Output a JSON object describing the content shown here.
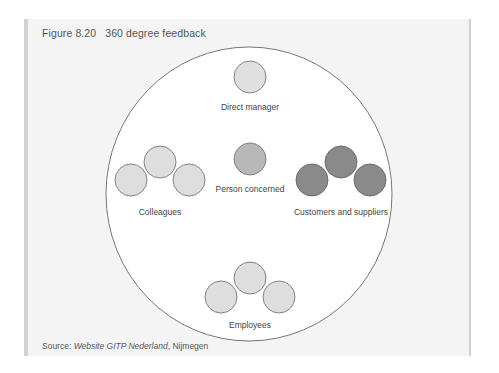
{
  "figure": {
    "number": "Figure 8.20",
    "title": "360 degree feedback"
  },
  "diagram": {
    "groups": [
      {
        "label": "Direct manager",
        "count": 1,
        "fill": "#e0e0e0"
      },
      {
        "label": "Person concerned",
        "count": 1,
        "fill": "#b8b8b8"
      },
      {
        "label": "Colleagues",
        "count": 3,
        "fill": "#dedede"
      },
      {
        "label": "Customers and suppliers",
        "count": 3,
        "fill": "#8a8a8a"
      },
      {
        "label": "Employees",
        "count": 3,
        "fill": "#dedede"
      }
    ]
  },
  "source": {
    "prefix": "Source: ",
    "text": "Website GITP Nederland",
    "suffix": ", Nijmegen"
  },
  "colors": {
    "panel_bg": "#f4f4f4",
    "outer_circle_fill": "#ffffff",
    "stroke": "#777777",
    "light_circle": "#dedede",
    "mid_circle": "#b8b8b8",
    "dark_circle": "#8a8a8a"
  }
}
